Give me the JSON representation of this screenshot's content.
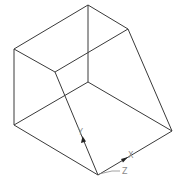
{
  "diagram": {
    "type": "isometric-wireframe",
    "colors": {
      "background": "#ffffff",
      "edge": "#3a3a3a",
      "axis_label": "#8a8a8a"
    },
    "axes": {
      "y_label": "Y",
      "x_label": "X",
      "z_label": "Z"
    }
  }
}
